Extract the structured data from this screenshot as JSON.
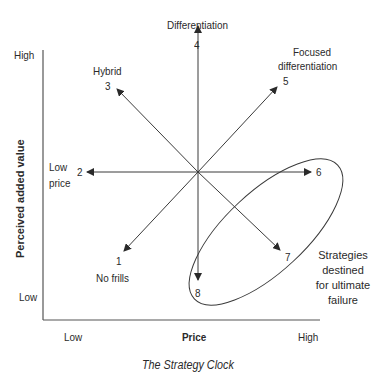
{
  "title": "The Strategy Clock",
  "axes": {
    "x_label": "Price",
    "y_label": "Perceived added value",
    "x_low": "Low",
    "x_high": "High",
    "y_low": "Low",
    "y_high": "High"
  },
  "strategies": [
    {
      "number": "1",
      "label": "No frills"
    },
    {
      "number": "2",
      "label": "Low price",
      "label_line1": "Low",
      "label_line2": "price"
    },
    {
      "number": "3",
      "label": "Hybrid"
    },
    {
      "number": "4",
      "label": "Differentiation"
    },
    {
      "number": "5",
      "label": "Focused differentiation",
      "label_line1": "Focused",
      "label_line2": "differentiation"
    },
    {
      "number": "6",
      "label": ""
    },
    {
      "number": "7",
      "label": ""
    },
    {
      "number": "8",
      "label": ""
    }
  ],
  "failure_zone": {
    "label_lines": [
      "Strategies",
      "destined",
      "for ultimate",
      "failure"
    ],
    "includes": [
      "6",
      "7",
      "8"
    ]
  },
  "colors": {
    "line": "#3a3a3a",
    "text": "#2a2a2a",
    "background": "#ffffff"
  }
}
